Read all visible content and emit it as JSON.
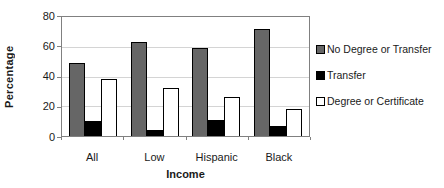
{
  "chart_data": {
    "type": "bar",
    "title": "",
    "categories": [
      "All",
      "Low",
      "Hispanic",
      "Black"
    ],
    "series": [
      {
        "name": "No Degree or Transfer",
        "color": "#666666",
        "values": [
          49,
          63,
          59,
          72
        ]
      },
      {
        "name": "Transfer",
        "color": "#000000",
        "values": [
          10,
          4,
          11,
          7
        ]
      },
      {
        "name": "Degree or Certificate",
        "color": "#ffffff",
        "values": [
          38,
          32,
          26,
          18
        ]
      }
    ],
    "xlabel": "Income",
    "ylabel": "Percentage",
    "ylim": [
      0,
      80
    ],
    "yticks": [
      0,
      20,
      40,
      60,
      80
    ],
    "grid": true,
    "legend_position": "right",
    "plot_background": "#ffffff",
    "frame_color": "#808080",
    "grid_color": "#d4d4d4"
  }
}
